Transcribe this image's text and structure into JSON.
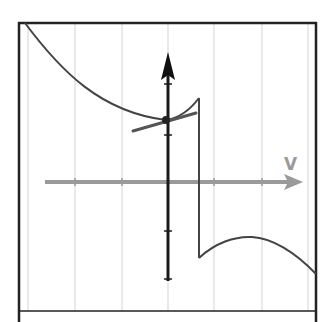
{
  "diagram": {
    "title": "",
    "x_axis": {
      "label": "V",
      "color": "#9a9a9a",
      "ticks_px": [
        75,
        122,
        214,
        262
      ]
    },
    "y_axis": {
      "label": "",
      "color": "#1a1a1a",
      "ticks_px": [
        84,
        135,
        231,
        279
      ]
    },
    "grid": {
      "vertical_lines_px": [
        28,
        75,
        122,
        214,
        262,
        308
      ],
      "color": "#d0d0d0"
    },
    "colors": {
      "frame": "#222222",
      "curve": "#444444",
      "x_axis": "#9a9a9a",
      "y_axis": "#1a1a1a",
      "tangent": "#555555"
    },
    "point": {
      "x": 166,
      "y": 120,
      "label": ""
    },
    "tangent": {
      "from": [
        133,
        131
      ],
      "to": [
        196,
        113
      ]
    },
    "upper_branch": "M25,23 C60,70 100,112 166,120 C180,118 190,110 199,98",
    "drop": {
      "x": 199,
      "from_y": 98,
      "to_y": 258
    },
    "lower_branch": "M199,258 C215,243 235,236 252,237 C272,238 295,252 316,274"
  }
}
